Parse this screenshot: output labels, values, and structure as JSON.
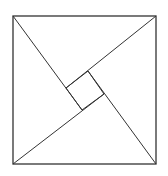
{
  "diagram": {
    "stroke_color": "#333333",
    "background": "#ffffff",
    "outer_square": {
      "x1": 13,
      "y1": 16,
      "x2": 156,
      "y2": 164
    },
    "inner_square": [
      [
        88,
        71
      ],
      [
        104,
        94
      ],
      [
        82,
        110
      ],
      [
        66,
        88
      ]
    ],
    "lines": [
      {
        "id": "tl-line",
        "from": [
          13,
          16
        ],
        "to": [
          82,
          110
        ]
      },
      {
        "id": "tr-line",
        "from": [
          156,
          16
        ],
        "to": [
          66,
          88
        ]
      },
      {
        "id": "br-line",
        "from": [
          156,
          164
        ],
        "to": [
          88,
          71
        ]
      },
      {
        "id": "bl-line",
        "from": [
          13,
          164
        ],
        "to": [
          104,
          94
        ]
      }
    ]
  }
}
